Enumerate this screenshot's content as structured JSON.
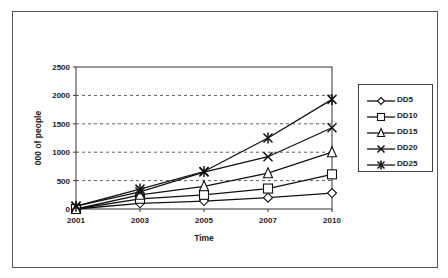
{
  "chart_data": {
    "type": "line",
    "title": "",
    "xlabel": "Time",
    "ylabel": "000 of people",
    "categories": [
      "2001",
      "2003",
      "2005",
      "2007",
      "2010"
    ],
    "ylim": [
      0,
      2500
    ],
    "yticks": [
      0,
      500,
      1000,
      1500,
      2000,
      2500
    ],
    "grid": "horizontal dashed",
    "legend_position": "right",
    "series": [
      {
        "name": "DD5",
        "marker": "diamond",
        "values": [
          0,
          100,
          140,
          200,
          280
        ]
      },
      {
        "name": "DD10",
        "marker": "square",
        "values": [
          0,
          180,
          250,
          360,
          610
        ]
      },
      {
        "name": "DD15",
        "marker": "triangle",
        "values": [
          0,
          250,
          400,
          630,
          1000
        ]
      },
      {
        "name": "DD20",
        "marker": "x",
        "values": [
          50,
          300,
          650,
          920,
          1430
        ]
      },
      {
        "name": "DD25",
        "marker": "asterisk",
        "values": [
          50,
          350,
          660,
          1250,
          1930
        ]
      }
    ]
  },
  "legend": {
    "items": [
      {
        "label": "DD5"
      },
      {
        "label": "DD10"
      },
      {
        "label": "DD15"
      },
      {
        "label": "DD20"
      },
      {
        "label": "DD25"
      }
    ]
  },
  "axes": {
    "x_title": "Time",
    "y_title": "000 of people",
    "x_ticks": [
      "2001",
      "2003",
      "2005",
      "2007",
      "2010"
    ],
    "y_ticks": [
      "0",
      "500",
      "1000",
      "1500",
      "2000",
      "2500"
    ]
  },
  "colors": {
    "line": "#111111",
    "grid": "#333333",
    "border": "#555555"
  }
}
